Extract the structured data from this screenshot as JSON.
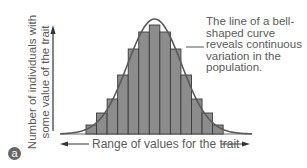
{
  "panel_label": "a",
  "chart_data": {
    "type": "bar",
    "title": "",
    "xlabel": "Range of values for the trait",
    "ylabel": "Number of individuals with some value of the trait",
    "ylabel_lines": [
      "Number of individuals with",
      "some value of the trait"
    ],
    "categories": [
      "1",
      "2",
      "3",
      "4",
      "5",
      "6",
      "7",
      "8",
      "9",
      "10",
      "11",
      "12",
      "13"
    ],
    "values": [
      9,
      21,
      35,
      59,
      85,
      102,
      109,
      102,
      85,
      59,
      35,
      21,
      9
    ],
    "ylim": [
      0,
      115
    ],
    "grid": false,
    "overlay": "bell-shaped normal curve",
    "annotation": "The line of a bell-shaped curve reveals continuous variation in the population.",
    "annotation_lines": [
      "The line of a bell-",
      "shaped curve",
      "reveals continuous",
      "variation in the",
      "population."
    ],
    "colors": {
      "bar_fill": "#8c8c8c",
      "bar_edge": "#3a3a3a",
      "curve": "#5a5a5a",
      "text": "#5a5a5a"
    }
  }
}
